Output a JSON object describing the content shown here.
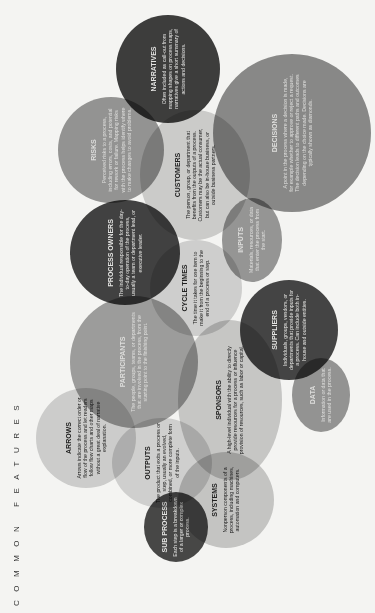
{
  "page_title": "COMMON FEATURES",
  "features": {
    "narratives": {
      "title": "NARRATIVES",
      "desc": "Often included as call-out from mapping shapes on process maps, narratives give a short summary of actions and decisions.",
      "color": "#3f3f3f"
    },
    "decisions": {
      "title": "DECISIONS",
      "desc": "A point in the process where a decision is made, for example whether to approve or reject a request. The decision leads to different paths and outcomes depending on the choice made. Decisions are typically shown as diamonds.",
      "color": "#8e8e8e"
    },
    "risks": {
      "title": "RISKS",
      "desc": "Perceived risks to a process, including errors, costs, and potential for rework or failure. Mapping risks with the process helps identify where to make changes to avoid problems.",
      "color": "#9a9a9a"
    },
    "customers": {
      "title": "CUSTOMERS",
      "desc": "The person, group, or department that benefits from the outputs of a process. Customers may be the actual consumer, but can also be in-house business, or outside business partners.",
      "color": "#d4d4d4"
    },
    "process_owners": {
      "title": "PROCESS OWNERS",
      "desc": "The individual responsible for the day-to-day operation of the process, usually a team or department lead, or executive leader.",
      "color": "#444444"
    },
    "inputs": {
      "title": "INPUTS",
      "desc": "Materials, resources, or data that enter the process from the start.",
      "color": "#9c9c9c"
    },
    "cycle_times": {
      "title": "CYCLE TIMES",
      "desc": "The time it takes for one item to make it from the beginning to the end of a process or step.",
      "color": "#d8d8d8"
    },
    "participants": {
      "title": "PARTICIPANTS",
      "desc": "The people, groups, teams, or departments that are involved in the process, from the starting point to the finishing point.",
      "color": "#a3a3a3"
    },
    "suppliers": {
      "title": "SUPPLIERS",
      "desc": "Individuals, groups, vendors, or departments that provide inputs for a process. Can include both in-house and outside entities.",
      "color": "#474747"
    },
    "sponsors": {
      "title": "SPONSORS",
      "desc": "A high-level individual with the ability to directly provide resources for a process or influence provision of resources, such as labor or capital.",
      "color": "#cfcfcf"
    },
    "data": {
      "title": "DATA",
      "desc": "Information or data that are used in the process.",
      "color": "#9a9a9a"
    },
    "arrows": {
      "title": "ARROWS",
      "desc": "Arrows indicate the correct order or flow of the process and let readers follow flow charts and other maps without a great deal of narrative explanation.",
      "color": "#d6d6d6"
    },
    "outputs": {
      "title": "OUTPUTS",
      "desc": "The product that exits a process or step, usually an evolved, combined, or more complete form of the inputs.",
      "color": "#d9d9d9"
    },
    "sub_process": {
      "title": "SUB PROCESS",
      "desc": "Each step is a breakdown of a larger or complex process.",
      "color": "#4a4a4a"
    },
    "systems": {
      "title": "SYSTEMS",
      "desc": "Nonperson components of a process, including machines, automation and computers.",
      "color": "#cdcdcd"
    }
  }
}
